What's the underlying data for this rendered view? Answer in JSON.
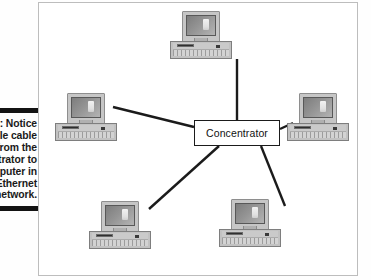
{
  "figure": {
    "label": "Figure 3-2:",
    "caption": "Notice the multiple cable runs from the concentrator to each computer in the Ethernet network.",
    "visible_caption_lines": [
      "re 3-2:",
      "ce the",
      "ultiple",
      "e runs",
      "m the",
      "ntrator",
      "each",
      "uter in",
      "hernet",
      "work."
    ],
    "rule_color": "#131313"
  },
  "diagram": {
    "type": "star-network-topology",
    "frame_border_color": "#bdbdbd",
    "line_color": "#1b1b1b",
    "hub": {
      "label": "Concentrator",
      "x": 155,
      "y": 117,
      "width": 86,
      "height": 26
    },
    "nodes": [
      {
        "id": "node-top",
        "name": "computer-top",
        "x": 131,
        "y": 8,
        "width": 62,
        "height": 48
      },
      {
        "id": "node-left",
        "name": "computer-left",
        "x": 16,
        "y": 90,
        "width": 62,
        "height": 48
      },
      {
        "id": "node-right",
        "name": "computer-right",
        "x": 248,
        "y": 90,
        "width": 62,
        "height": 48
      },
      {
        "id": "node-bottom-left",
        "name": "computer-bottom-left",
        "x": 50,
        "y": 198,
        "width": 62,
        "height": 48
      },
      {
        "id": "node-bottom-right",
        "name": "computer-bottom-right",
        "x": 180,
        "y": 196,
        "width": 62,
        "height": 48
      }
    ],
    "links": [
      {
        "from": "hub",
        "to": "node-top",
        "x1": 198,
        "y1": 117,
        "x2": 198,
        "y2": 56
      },
      {
        "from": "hub",
        "to": "node-left",
        "x1": 155,
        "y1": 124,
        "x2": 74,
        "y2": 104
      },
      {
        "from": "hub",
        "to": "node-right",
        "x1": 241,
        "y1": 126,
        "x2": 254,
        "y2": 120
      },
      {
        "from": "hub",
        "to": "node-bottom-left",
        "x1": 180,
        "y1": 143,
        "x2": 110,
        "y2": 206
      },
      {
        "from": "hub",
        "to": "node-bottom-right",
        "x1": 222,
        "y1": 143,
        "x2": 246,
        "y2": 203
      }
    ]
  }
}
